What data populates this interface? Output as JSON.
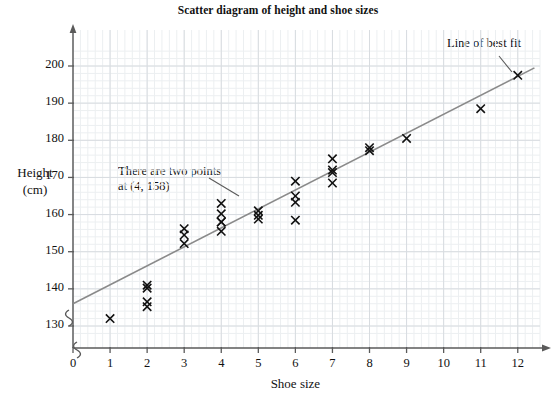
{
  "chart_data": {
    "type": "scatter",
    "title": "Scatter diagram of height and shoe sizes",
    "xlabel": "Shoe size",
    "ylabel": "Height (cm)",
    "ylabel_lines": [
      "Height",
      "(cm)"
    ],
    "xlim": [
      0,
      12.6
    ],
    "ylim": [
      126,
      204
    ],
    "xticks": [
      "0",
      "1",
      "2",
      "3",
      "4",
      "5",
      "6",
      "7",
      "8",
      "9",
      "10",
      "11",
      "12"
    ],
    "yticks": [
      "130",
      "140",
      "150",
      "160",
      "170",
      "180",
      "190",
      "200"
    ],
    "grid": true,
    "grid_minor": true,
    "axis_break_y": true,
    "axis_break_x": true,
    "points": [
      {
        "x": 1,
        "y": 132
      },
      {
        "x": 2,
        "y": 141
      },
      {
        "x": 2,
        "y": 140.2
      },
      {
        "x": 2,
        "y": 136.5
      },
      {
        "x": 2,
        "y": 135.2
      },
      {
        "x": 3,
        "y": 156.2
      },
      {
        "x": 3,
        "y": 154.5
      },
      {
        "x": 3,
        "y": 152.2
      },
      {
        "x": 4,
        "y": 163
      },
      {
        "x": 4,
        "y": 160.2
      },
      {
        "x": 4,
        "y": 158
      },
      {
        "x": 4,
        "y": 158
      },
      {
        "x": 4,
        "y": 155.5
      },
      {
        "x": 5,
        "y": 161
      },
      {
        "x": 5,
        "y": 159.8
      },
      {
        "x": 5,
        "y": 158.8
      },
      {
        "x": 6,
        "y": 169
      },
      {
        "x": 6,
        "y": 165
      },
      {
        "x": 6,
        "y": 163.3
      },
      {
        "x": 6,
        "y": 158.5
      },
      {
        "x": 7,
        "y": 175
      },
      {
        "x": 7,
        "y": 172
      },
      {
        "x": 7,
        "y": 171.3
      },
      {
        "x": 7,
        "y": 168.5
      },
      {
        "x": 8,
        "y": 178
      },
      {
        "x": 8,
        "y": 177.2
      },
      {
        "x": 9,
        "y": 180.5
      },
      {
        "x": 11,
        "y": 188.5
      },
      {
        "x": 12,
        "y": 197.5
      }
    ],
    "line_of_best_fit": {
      "x1": 0,
      "y1": 136,
      "x2": 12.45,
      "y2": 199.5
    },
    "annotations": [
      {
        "name": "two-points-note",
        "lines": [
          "There are two points",
          "at (4, 158)"
        ],
        "leader_from": {
          "x_px": 239,
          "y_px": 196
        },
        "leader_to": {
          "x_px": 209,
          "y_px": 178
        }
      },
      {
        "name": "line-of-best-fit-label",
        "lines": [
          "Line of best fit"
        ],
        "leader_from": {
          "x_px": 499,
          "y_px": 56
        },
        "leader_to": {
          "x_px": 512,
          "y_px": 72
        }
      }
    ]
  },
  "labels": {
    "title": "Scatter diagram of height and shoe sizes",
    "x_axis": "Shoe size",
    "y_axis_line1": "Height",
    "y_axis_line2": "(cm)",
    "note_line1": "There are two points",
    "note_line2": "at (4, 158)",
    "best_fit": "Line of best fit"
  },
  "colors": {
    "ink": "#1a1a1a",
    "axis": "#5a5a5a",
    "grid_major": "#d8dce0",
    "grid_minor": "#eceff1",
    "marker": "#111111",
    "fit_line": "#8a8a8a",
    "background": "#ffffff"
  }
}
